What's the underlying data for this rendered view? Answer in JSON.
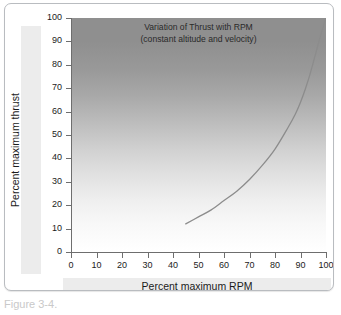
{
  "figure": {
    "caption_fragment": "Figure 3-4."
  },
  "chart_data": {
    "type": "line",
    "title": "Variation of Thrust with RPM",
    "subtitle": "(constant altitude and velocity)",
    "xlabel": "Percent maximum RPM",
    "ylabel": "Percent maximum thrust",
    "xlim": [
      0,
      100
    ],
    "ylim": [
      0,
      100
    ],
    "xticks": [
      0,
      10,
      20,
      30,
      40,
      50,
      60,
      70,
      80,
      90,
      100
    ],
    "yticks": [
      0,
      10,
      20,
      30,
      40,
      50,
      60,
      70,
      80,
      90,
      100
    ],
    "grid": false,
    "legend": "none",
    "series": [
      {
        "name": "Thrust vs RPM",
        "color": "#8c8c8c",
        "x": [
          45,
          50,
          55,
          60,
          65,
          70,
          75,
          80,
          85,
          88,
          90,
          92,
          94,
          96,
          98,
          100
        ],
        "y": [
          12,
          15,
          18,
          22,
          26,
          31,
          37,
          44,
          53,
          59,
          64,
          70,
          77,
          85,
          93,
          100
        ]
      }
    ],
    "background": {
      "type": "vertical-gradient",
      "top_color": "#8f8f8f",
      "bottom_color": "#ffffff"
    }
  }
}
